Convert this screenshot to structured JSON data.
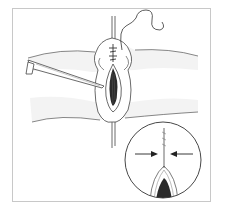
{
  "figure": {
    "type": "surgical-illustration",
    "caption": "",
    "colors": {
      "line": "#3a3a3a",
      "shade": "#2a2a2a",
      "hatch": "#bdbdbd",
      "frame": "#c8c8c8"
    },
    "inset": {
      "label": "magnified-detail",
      "arrows": [
        "right-pointing-arrow",
        "left-pointing-arrow"
      ]
    }
  }
}
